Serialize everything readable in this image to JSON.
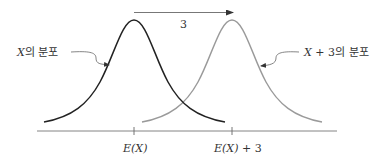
{
  "diagram": {
    "type": "distribution-shift",
    "curves": [
      {
        "name": "X",
        "label": "X의 분포",
        "label_var": "X",
        "label_suffix": "의 분포",
        "color": "#222222",
        "center_label": "E(X)"
      },
      {
        "name": "X+3",
        "label": "X + 3의 분포",
        "label_var": "X",
        "label_mid": " + 3",
        "label_suffix": "의 분포",
        "color": "#9a9a9a",
        "center_label": "E(X) + 3"
      }
    ],
    "shift": {
      "label": "3",
      "color": "#555555"
    },
    "axis": {
      "ticks": [
        {
          "label_var": "E(X)",
          "label_rest": ""
        },
        {
          "label_var": "E(X)",
          "label_rest": " + 3"
        }
      ],
      "color": "#666666"
    }
  }
}
